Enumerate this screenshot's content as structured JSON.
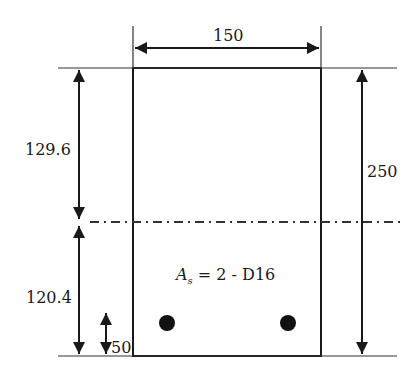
{
  "diagram": {
    "type": "beam-cross-section",
    "colors": {
      "line": "#1a1a1a",
      "background": "#ffffff"
    },
    "dimensions": {
      "width": "150",
      "height": "250",
      "neutral_axis_top": "129.6",
      "neutral_axis_bottom": "120.4",
      "cover": "50"
    },
    "reinforcement": {
      "symbol": "A",
      "subscript": "s",
      "equals": "= 2 -  D16",
      "bar_count": 2
    }
  }
}
